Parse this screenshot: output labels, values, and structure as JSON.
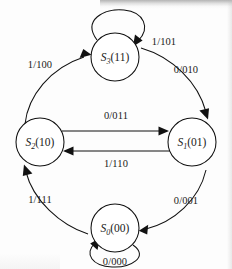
{
  "figure": {
    "type": "state-transition-diagram",
    "machine_type": "mealy",
    "label_format": "input/output"
  },
  "states": [
    {
      "id": "S3",
      "name": "S",
      "subscript": "3",
      "encoding": "(11)",
      "cx": 115,
      "cy": 57,
      "r": 24
    },
    {
      "id": "S1",
      "name": "S",
      "subscript": "1",
      "encoding": "(01)",
      "cx": 192,
      "cy": 142,
      "r": 24
    },
    {
      "id": "S0",
      "name": "S",
      "subscript": "0",
      "encoding": "(00)",
      "cx": 115,
      "cy": 228,
      "r": 24
    },
    {
      "id": "S2",
      "name": "S",
      "subscript": "2",
      "encoding": "(10)",
      "cx": 40,
      "cy": 142,
      "r": 24
    }
  ],
  "transitions": [
    {
      "id": "t-s2-s3",
      "from": "S2",
      "to": "S3",
      "label": "1/100",
      "input": "1",
      "output": "100",
      "label_x": 40,
      "label_y": 68,
      "kind": "arc"
    },
    {
      "id": "t-s3-s3",
      "from": "S3",
      "to": "S3",
      "label": "1/101",
      "input": "1",
      "output": "101",
      "label_x": 164,
      "label_y": 45,
      "kind": "self-loop"
    },
    {
      "id": "t-s3-s1",
      "from": "S3",
      "to": "S1",
      "label": "0/010",
      "input": "0",
      "output": "010",
      "label_x": 186,
      "label_y": 73,
      "kind": "arc"
    },
    {
      "id": "t-s2-s1",
      "from": "S2",
      "to": "S1",
      "label": "0/011",
      "input": "0",
      "output": "011",
      "label_x": 116,
      "label_y": 119,
      "kind": "straight"
    },
    {
      "id": "t-s1-s2",
      "from": "S1",
      "to": "S2",
      "label": "1/110",
      "input": "1",
      "output": "110",
      "label_x": 116,
      "label_y": 163,
      "kind": "straight"
    },
    {
      "id": "t-s1-s0",
      "from": "S1",
      "to": "S0",
      "label": "0/001",
      "input": "0",
      "output": "001",
      "label_x": 186,
      "label_y": 204,
      "kind": "arc"
    },
    {
      "id": "t-s0-s2",
      "from": "S0",
      "to": "S2",
      "label": "1/111",
      "input": "1",
      "output": "111",
      "label_x": 40,
      "label_y": 203,
      "kind": "arc"
    },
    {
      "id": "t-s0-s0",
      "from": "S0",
      "to": "S0",
      "label": "0/000",
      "input": "0",
      "output": "000",
      "label_x": 115,
      "label_y": 265,
      "kind": "self-loop"
    }
  ],
  "colors": {
    "stroke": "#111111",
    "text": "#1a1a1a",
    "background": "#fdfdfd"
  }
}
